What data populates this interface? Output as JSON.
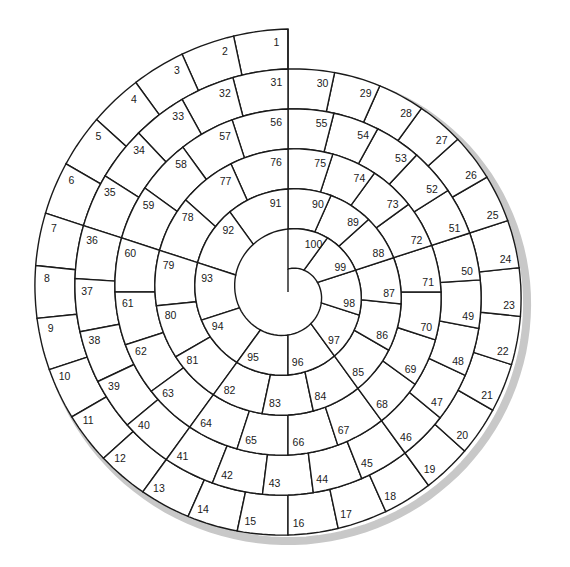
{
  "board": {
    "type": "spiral-track",
    "total_cells": 100,
    "start_cell": 1,
    "finish_cell": 100,
    "direction": "counter-clockwise inward",
    "cells_per_revolution": [
      30,
      25,
      20,
      15,
      10
    ],
    "colors": {
      "background": "#ffffff",
      "line": "#1a1a1a",
      "cell_fill": "#ffffff",
      "shadow": "#c8c8c8",
      "number": "#1a1a1a"
    }
  },
  "geometry": {
    "center_x": 288,
    "center_y": 292,
    "outer_radius": 263,
    "pitch_per_revolution": 40,
    "center_radius": 62
  },
  "cells": [
    "1",
    "2",
    "3",
    "4",
    "5",
    "6",
    "7",
    "8",
    "9",
    "10",
    "11",
    "12",
    "13",
    "14",
    "15",
    "16",
    "17",
    "18",
    "19",
    "20",
    "21",
    "22",
    "23",
    "24",
    "25",
    "26",
    "27",
    "28",
    "29",
    "30",
    "31",
    "32",
    "33",
    "34",
    "35",
    "36",
    "37",
    "38",
    "39",
    "40",
    "41",
    "42",
    "43",
    "44",
    "45",
    "46",
    "47",
    "48",
    "49",
    "50",
    "51",
    "52",
    "53",
    "54",
    "55",
    "56",
    "57",
    "58",
    "59",
    "60",
    "61",
    "62",
    "63",
    "64",
    "65",
    "66",
    "67",
    "68",
    "69",
    "70",
    "71",
    "72",
    "73",
    "74",
    "75",
    "76",
    "77",
    "78",
    "79",
    "80",
    "81",
    "82",
    "83",
    "84",
    "85",
    "86",
    "87",
    "88",
    "89",
    "90",
    "91",
    "92",
    "93",
    "94",
    "95",
    "96",
    "97",
    "98",
    "99",
    "100"
  ]
}
